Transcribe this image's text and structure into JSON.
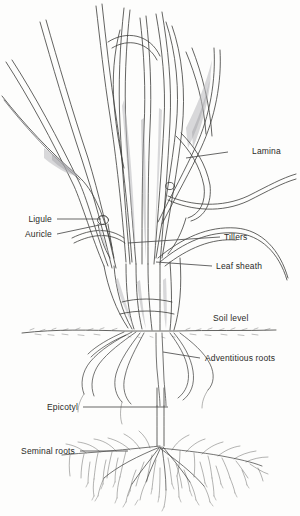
{
  "figure": {
    "style": "pen-and-ink line drawing",
    "background_color": "#fdfdfc",
    "ink_color": "#3a3a38",
    "text_color": "#2a2a28"
  },
  "labels": [
    {
      "id": "lamina",
      "text": "Lamina",
      "side": "right",
      "text_x": 252,
      "text_y": 152,
      "leader_x1": 228,
      "leader_y1": 152,
      "leader_x2": 186,
      "leader_y2": 158
    },
    {
      "id": "ligule",
      "text": "Ligule",
      "side": "left",
      "text_x": 52,
      "text_y": 221,
      "leader_x1": 57,
      "leader_y1": 219,
      "leader_x2": 101,
      "leader_y2": 219
    },
    {
      "id": "auricle",
      "text": "Auricle",
      "side": "left",
      "text_x": 52,
      "text_y": 236,
      "leader_x1": 57,
      "leader_y1": 234,
      "leader_x2": 104,
      "leader_y2": 224
    },
    {
      "id": "tillers",
      "text": "Tillers",
      "side": "right",
      "text_x": 224,
      "text_y": 240,
      "leader_x1": 220,
      "leader_y1": 237,
      "leader_x2": 128,
      "leader_y2": 243
    },
    {
      "id": "leaf-sheath",
      "text": "Leaf sheath",
      "side": "right",
      "text_x": 216,
      "text_y": 269,
      "leader_x1": 212,
      "leader_y1": 266,
      "leader_x2": 156,
      "leader_y2": 262
    },
    {
      "id": "soil-level",
      "text": "Soil level",
      "side": "right",
      "text_x": 213,
      "text_y": 320,
      "leader_x1": 0,
      "leader_y1": 0,
      "leader_x2": 0,
      "leader_y2": 0
    },
    {
      "id": "adventitious-roots",
      "text": "Adventitious roots",
      "side": "right",
      "text_x": 205,
      "text_y": 361,
      "leader_x1": 200,
      "leader_y1": 358,
      "leader_x2": 163,
      "leader_y2": 352
    },
    {
      "id": "epicotyl",
      "text": "Epicotyl",
      "side": "left",
      "text_x": 78,
      "text_y": 409,
      "leader_x1": 83,
      "leader_y1": 407,
      "leader_x2": 168,
      "leader_y2": 407
    },
    {
      "id": "seminal-roots",
      "text": "Seminal roots",
      "side": "left",
      "text_x": 75,
      "text_y": 453,
      "leader_x1": 80,
      "leader_y1": 451,
      "leader_x2": 128,
      "leader_y2": 451
    }
  ],
  "plant_parts": {
    "shoot_label": "grass shoot with tillers and leaf blades",
    "soil_line_y": 330,
    "crown_x": 148,
    "crown_y": 330,
    "seminal_root_center_x": 160,
    "seminal_root_center_y": 448
  }
}
